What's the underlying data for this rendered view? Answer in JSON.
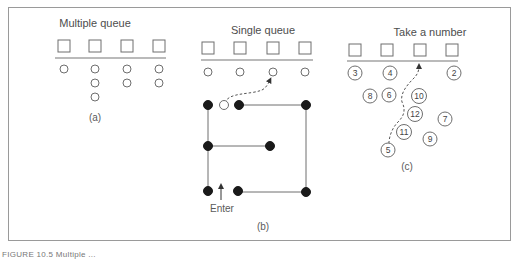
{
  "figure": {
    "panels": [
      {
        "id": "a",
        "title": "Multiple queue",
        "label": "(a)",
        "servers": 4,
        "queue_lengths": [
          1,
          3,
          2,
          2
        ]
      },
      {
        "id": "b",
        "title": "Single queue",
        "label": "(b)",
        "servers": 4,
        "enter_label": "Enter"
      },
      {
        "id": "c",
        "title": "Take a number",
        "label": "(c)",
        "servers": 4,
        "tickets": [
          "3",
          "4",
          "2",
          "8",
          "6",
          "10",
          "12",
          "7",
          "11",
          "9",
          "5"
        ]
      }
    ],
    "caption": "FIGURE 10.5 Multiple ..."
  },
  "colors": {
    "stroke": "#6e6e6e",
    "fill_dark": "#1a1a1a",
    "frame": "#9a9a9a"
  }
}
